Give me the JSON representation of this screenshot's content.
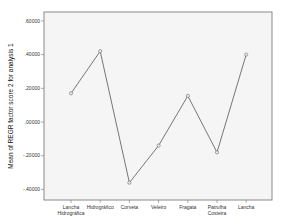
{
  "chart_data": {
    "type": "line",
    "title": "",
    "xlabel": "",
    "ylabel": "Mean of REGR factor score   2 for analysis 1",
    "categories": [
      [
        "Lancha",
        "Hidrográfica"
      ],
      [
        "Hidrográfico"
      ],
      [
        "Corveta"
      ],
      [
        "Veleiro"
      ],
      [
        "Fragata"
      ],
      [
        "Patrulha",
        "Costeira"
      ],
      [
        "Lancha"
      ]
    ],
    "series": [
      {
        "name": "Mean of REGR factor score 2 for analysis 1",
        "values": [
          0.17,
          0.42,
          -0.36,
          -0.14,
          0.155,
          -0.18,
          0.4
        ]
      }
    ],
    "ylim": [
      -0.45,
      0.66
    ],
    "yticks": [
      0.6,
      0.4,
      0.2,
      0.0,
      -0.2,
      -0.4
    ],
    "ytick_labels": [
      ".60000",
      ".40000",
      ".20000",
      ".00000",
      "-.20000",
      "-.40000"
    ],
    "grid": false,
    "legend": "none",
    "colors": {
      "line": "#555555",
      "marker": "#666666",
      "frame": "#888888",
      "plot_bg": "#f5f5f5"
    }
  }
}
